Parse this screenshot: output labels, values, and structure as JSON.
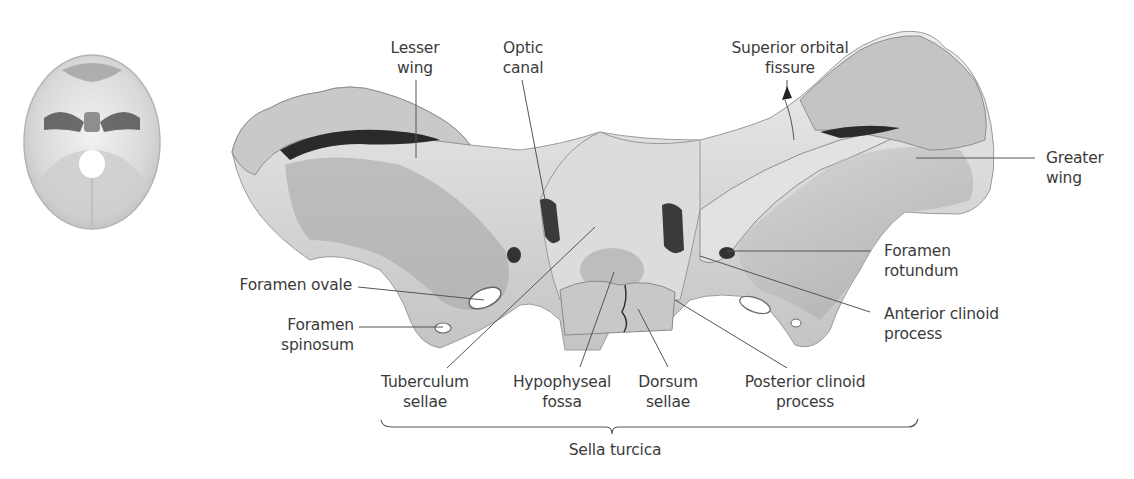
{
  "figure": {
    "inset": {
      "name": "skull-base-orientation-inset",
      "description": "Cranial base viewed from above"
    },
    "main": {
      "name": "sphenoid-bone-superior-view"
    }
  },
  "labels": {
    "lesser_wing": {
      "line1": "Lesser",
      "line2": "wing"
    },
    "optic_canal": {
      "line1": "Optic",
      "line2": "canal"
    },
    "superior_orbital_fissure": {
      "line1": "Superior orbital",
      "line2": "fissure"
    },
    "greater_wing": {
      "line1": "Greater",
      "line2": "wing"
    },
    "foramen_rotundum": {
      "line1": "Foramen",
      "line2": "rotundum"
    },
    "anterior_clinoid_process": {
      "line1": "Anterior clinoid",
      "line2": "process"
    },
    "foramen_ovale": {
      "line1": "Foramen ovale"
    },
    "foramen_spinosum": {
      "line1": "Foramen",
      "line2": "spinosum"
    },
    "tuberculum_sellae": {
      "line1": "Tuberculum",
      "line2": "sellae"
    },
    "hypophyseal_fossa": {
      "line1": "Hypophyseal",
      "line2": "fossa"
    },
    "dorsum_sellae": {
      "line1": "Dorsum",
      "line2": "sellae"
    },
    "posterior_clinoid_process": {
      "line1": "Posterior clinoid",
      "line2": "process"
    },
    "sella_turcica": {
      "line1": "Sella turcica"
    }
  },
  "colors": {
    "background": "#ffffff",
    "bone_light": "#e6e6e6",
    "bone_mid": "#b9b9b9",
    "bone_dark": "#3c3c3c",
    "leader_line": "#555555",
    "text": "#3b3b3b"
  }
}
